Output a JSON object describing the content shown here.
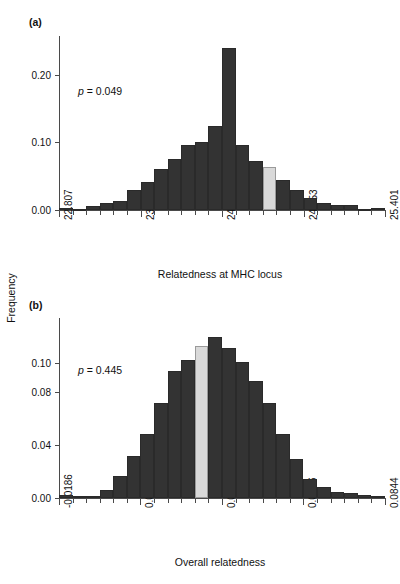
{
  "figure": {
    "ylabel": "Frequency",
    "bar_color": "#333333",
    "highlight_color": "#d9d9d9",
    "axis_color": "#4a4a4a"
  },
  "chart_data": [
    {
      "type": "bar",
      "panel": "(a)",
      "title": "",
      "annotation": "p = 0.049",
      "annotation_p_italic": "p",
      "annotation_rest": " = 0.049",
      "xlabel": "Relatedness at MHC locus",
      "ylabel": "Frequency",
      "grid": false,
      "legend": "none",
      "xlim": [
        22.807,
        25.401
      ],
      "ylim": [
        0.0,
        0.24
      ],
      "yticks": [
        0.0,
        0.1,
        0.2
      ],
      "ytick_labels": [
        "0.00",
        "0.10",
        "0.20"
      ],
      "xticks": [
        22.807,
        23.456,
        24.104,
        24.753,
        25.401
      ],
      "xtick_labels": [
        "22.807",
        "23.456",
        "24.104",
        "24.753",
        "25.401"
      ],
      "bin_edges": [
        22.807,
        22.9151,
        23.0232,
        23.1313,
        23.2394,
        23.3475,
        23.4556,
        23.5637,
        23.6718,
        23.7799,
        23.888,
        23.9961,
        24.1042,
        24.2123,
        24.3204,
        24.4285,
        24.5366,
        24.6447,
        24.7528,
        24.8609,
        24.969,
        25.0771,
        25.1852,
        25.2933,
        25.401
      ],
      "categories": [
        "22.807",
        "22.915",
        "23.023",
        "23.131",
        "23.239",
        "23.348",
        "23.456",
        "23.564",
        "23.672",
        "23.780",
        "23.888",
        "23.996",
        "24.104",
        "24.212",
        "24.320",
        "24.429",
        "24.537",
        "24.645",
        "24.753",
        "24.861",
        "24.969",
        "25.077",
        "25.185",
        "25.293"
      ],
      "values": [
        0.003,
        0.002,
        0.006,
        0.01,
        0.013,
        0.027,
        0.038,
        0.056,
        0.071,
        0.09,
        0.094,
        0.116,
        0.223,
        0.09,
        0.068,
        0.059,
        0.041,
        0.028,
        0.017,
        0.01,
        0.007,
        0.007,
        0.0,
        0.003
      ],
      "highlight_index": 15,
      "highlight_value": 0.059,
      "observed_value": 24.456
    },
    {
      "type": "bar",
      "panel": "(b)",
      "title": "",
      "annotation": "p = 0.445",
      "annotation_p_italic": "p",
      "annotation_rest": " = 0.445",
      "xlabel": "Overall relatedness",
      "ylabel": "Frequency",
      "grid": false,
      "legend": "none",
      "xlim": [
        -0.0186,
        0.0844
      ],
      "ylim": [
        0.0,
        0.115
      ],
      "yticks": [
        0.0,
        0.04,
        0.08,
        0.1
      ],
      "ytick_labels": [
        "0.00",
        "0.04",
        "0.08",
        "0.10"
      ],
      "xticks": [
        -0.0186,
        0.0071,
        0.0329,
        0.0586,
        0.0844
      ],
      "xtick_labels": [
        "-0.0186",
        "0.0071",
        "0.0329",
        "0.0586",
        "0.0844"
      ],
      "bin_edges": [
        -0.0186,
        -0.01431,
        -0.01002,
        -0.00573,
        -0.00144,
        0.00285,
        0.00714,
        0.01143,
        0.01572,
        0.02001,
        0.0243,
        0.02859,
        0.03288,
        0.03717,
        0.04146,
        0.04575,
        0.05004,
        0.05433,
        0.05862,
        0.06291,
        0.0672,
        0.07149,
        0.07578,
        0.08007,
        0.0844
      ],
      "categories": [
        "-0.0186",
        "-0.0143",
        "-0.0100",
        "-0.0057",
        "-0.0014",
        "0.0029",
        "0.0071",
        "0.0114",
        "0.0157",
        "0.0200",
        "0.0243",
        "0.0286",
        "0.0329",
        "0.0372",
        "0.0415",
        "0.0458",
        "0.0500",
        "0.0543",
        "0.0586",
        "0.0629",
        "0.0672",
        "0.0715",
        "0.0758",
        "0.0801"
      ],
      "values": [
        0.002,
        0.001,
        0.001,
        0.005,
        0.014,
        0.027,
        0.041,
        0.061,
        0.081,
        0.088,
        0.097,
        0.103,
        0.096,
        0.087,
        0.075,
        0.061,
        0.041,
        0.025,
        0.012,
        0.007,
        0.004,
        0.003,
        0.002,
        0.001
      ],
      "highlight_index": 10,
      "highlight_value": 0.097,
      "observed_value": 0.0243
    }
  ]
}
